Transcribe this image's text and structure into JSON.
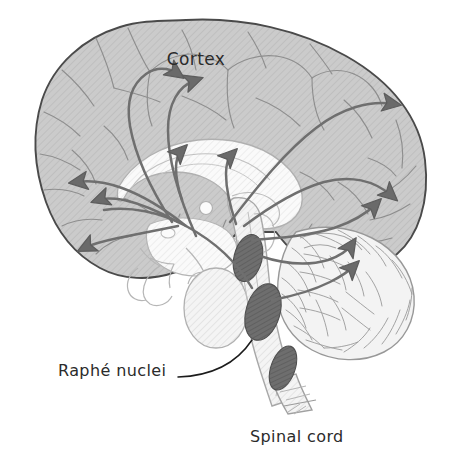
{
  "figure": {
    "background_color": "#ffffff"
  },
  "labels": {
    "cortex": "Cortex",
    "raphe": "Raphé nuclei",
    "spinal_cord": "Spinal cord"
  },
  "structures": {
    "cortex_name": "cerebral-cortex",
    "corpus_callosum_name": "corpus-callosum",
    "cerebellum_name": "cerebellum",
    "brainstem_name": "brainstem",
    "raphe_nuclei_name": "raphe-nuclei",
    "spinal_cord_name": "spinal-cord",
    "thalamus_name": "thalamus"
  },
  "colors": {
    "background": "#ffffff",
    "cortex_fill": "#c9c9c9",
    "cortex_hatch": "#bdbdbd",
    "cortex_outline": "#4a4a4a",
    "inner_fill": "#fafafa",
    "inner_outline": "#b0b0b0",
    "sulci_stroke": "#8e8e8e",
    "nuclei_fill": "#6e6e6e",
    "nuclei_hatch": "#5c5c5c",
    "nuclei_outline": "#4f4f4f",
    "arrow_stroke": "#6f6f6f",
    "arrow_head": "#6a6a6a",
    "cerebellum_fill": "#f2f2f2",
    "cerebellum_stroke": "#9a9a9a",
    "leader_line": "#1c1c1c",
    "label_text": "#2b2b2b"
  },
  "annotations": {
    "arrow_count_total": 9,
    "raphe_nuclei_count": 3,
    "leader_line_present": true
  },
  "icons": {
    "arrowhead": "triangle-arrowhead",
    "leader": "leader-line"
  }
}
